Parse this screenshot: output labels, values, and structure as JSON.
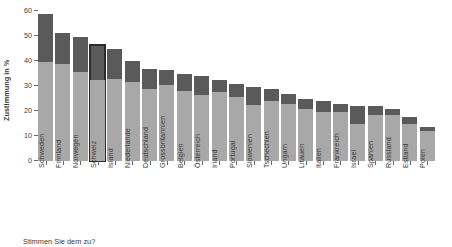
{
  "chart_data": {
    "type": "bar",
    "subtype": "stacked-bar",
    "title": "",
    "subtitle": "",
    "caption": "Stimmen Sie dem zu?",
    "xlabel": "",
    "ylabel": "Zustimmung in %",
    "ylim": [
      0,
      60
    ],
    "yticks": [
      0,
      10,
      20,
      30,
      40,
      50,
      60
    ],
    "ytick_labels": [
      "0",
      "10",
      "20",
      "30",
      "40",
      "50",
      "60"
    ],
    "grid": false,
    "legend": "none",
    "highlighted_category": "Schweiz",
    "categories": [
      "Schweden",
      "Finnland",
      "Norwegen",
      "Schweiz",
      "Island",
      "Niederlande",
      "Deutschland",
      "Grossbritannien",
      "Belgien",
      "Österreich",
      "Irland",
      "Portugal",
      "Slowenien",
      "Tschechien",
      "Ungarn",
      "Litauen",
      "Italien",
      "Frankreich",
      "Israel",
      "Spanien",
      "Russland",
      "Estland",
      "Polen"
    ],
    "series": [
      {
        "name": "untere Kategorie",
        "color": "#a8a8a8",
        "values": [
          39.5,
          39.0,
          35.5,
          32.5,
          33.0,
          31.5,
          29.0,
          30.5,
          28.0,
          26.5,
          27.5,
          25.5,
          22.5,
          24.0,
          23.0,
          21.0,
          19.5,
          19.5,
          15.0,
          18.5,
          18.5,
          15.0,
          12.0
        ]
      },
      {
        "name": "obere Kategorie",
        "color": "#5a5a5a",
        "values": [
          19.3,
          12.3,
          14.0,
          14.0,
          12.0,
          8.5,
          8.0,
          6.0,
          7.0,
          7.5,
          5.0,
          5.5,
          7.0,
          5.0,
          4.0,
          4.0,
          4.5,
          3.5,
          7.0,
          3.5,
          2.5,
          2.5,
          1.5
        ]
      }
    ],
    "totals": [
      58.8,
      51.3,
      49.5,
      46.5,
      45.0,
      40.0,
      37.0,
      36.5,
      35.0,
      34.0,
      32.5,
      31.0,
      29.5,
      29.0,
      27.0,
      25.0,
      24.0,
      23.0,
      22.0,
      22.0,
      21.0,
      17.5,
      13.5
    ]
  },
  "axis": {
    "y_title": "Zustimmung in %"
  }
}
